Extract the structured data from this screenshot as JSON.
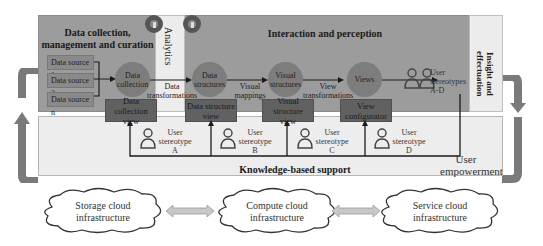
{
  "diagram": {
    "sections": {
      "data_collection": "Data collection, management and curation",
      "analytics": "Analytics",
      "interaction": "Interaction and perception",
      "insight": "Insight and effectuation",
      "knowledge": "Knowledge-based support",
      "empowerment_line1": "User",
      "empowerment_line2": "empowerment"
    },
    "sources": [
      "Data source 1",
      "Data source 2",
      "Data source n"
    ],
    "nodes": [
      {
        "id": "collection",
        "label": "Data collection"
      },
      {
        "id": "structures",
        "label": "Data structures"
      },
      {
        "id": "visual",
        "label": "Visual structures"
      },
      {
        "id": "views",
        "label": "Views"
      }
    ],
    "edges": [
      {
        "from": "collection",
        "to": "structures",
        "label": "Data transformations"
      },
      {
        "from": "structures",
        "to": "visual",
        "label": "Visual mappings"
      },
      {
        "from": "visual",
        "to": "views",
        "label": "View transformations"
      }
    ],
    "view_boxes": [
      {
        "line1": "Data collection",
        "line2": "view"
      },
      {
        "line1": "Data structure",
        "line2": "view"
      },
      {
        "line1": "Visual structure",
        "line2": "view"
      },
      {
        "line1": "View",
        "line2": "configurator"
      }
    ],
    "users": [
      {
        "line1": "User",
        "line2": "stereotype",
        "line3": "A"
      },
      {
        "line1": "User",
        "line2": "stereotype",
        "line3": "B"
      },
      {
        "line1": "User",
        "line2": "stereotype",
        "line3": "C"
      },
      {
        "line1": "User",
        "line2": "stereotype",
        "line3": "D"
      }
    ],
    "users_group": {
      "line1": "User",
      "line2": "stereotypes",
      "line3": "A-D"
    },
    "clouds": [
      {
        "line1": "Storage cloud",
        "line2": "infrastructure"
      },
      {
        "line1": "Compute cloud",
        "line2": "infrastructure"
      },
      {
        "line1": "Service cloud",
        "line2": "infrastructure"
      }
    ],
    "icons": [
      "gear-icon",
      "gear-icon",
      "user-icon",
      "users-icon",
      "cloud-icon",
      "double-arrow-icon",
      "loop-arrow-icon"
    ],
    "colors": {
      "panel_dark": "#9c9c9c",
      "panel_light": "#ededed",
      "node_fill": "#7d7d7d",
      "box_fill": "#616161",
      "arrow_gray": "#7a7a7a"
    }
  }
}
